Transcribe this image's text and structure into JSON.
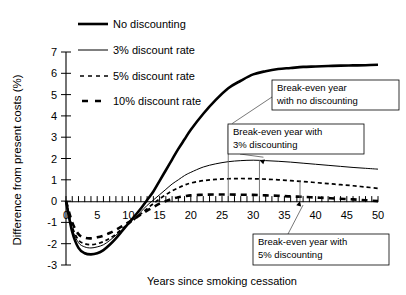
{
  "chart_data": {
    "type": "line",
    "title": "",
    "xlabel": "Years since smoking cessation",
    "ylabel": "Difference from present costs (%)",
    "xlim": [
      0,
      50
    ],
    "ylim": [
      -3,
      7
    ],
    "xticks": [
      0,
      5,
      10,
      15,
      20,
      25,
      30,
      35,
      40,
      45,
      50
    ],
    "xticklabels": [
      "0",
      "5",
      "10",
      "15",
      "20",
      "25",
      "30",
      "35",
      "40",
      "45",
      "50"
    ],
    "yticks": [
      -3,
      -2,
      -1,
      0,
      1,
      2,
      3,
      4,
      5,
      6,
      7
    ],
    "yticklabels": [
      "-3",
      "-2",
      "-1",
      "0",
      "1",
      "2",
      "3",
      "4",
      "5",
      "6",
      "7"
    ],
    "grid": false,
    "legend_position": "top-left",
    "x": [
      0,
      1,
      2,
      3,
      4,
      5,
      6,
      7,
      8,
      9,
      10,
      11,
      12,
      13,
      14,
      15,
      16,
      17,
      18,
      19,
      20,
      22,
      24,
      26,
      28,
      30,
      32,
      34,
      36,
      38,
      40,
      42,
      44,
      46,
      48,
      50
    ],
    "series": [
      {
        "name": "No discounting",
        "style": "solid-bold",
        "values": [
          0,
          -1.45,
          -2.2,
          -2.45,
          -2.5,
          -2.45,
          -2.3,
          -2.05,
          -1.75,
          -1.4,
          -1.05,
          -0.7,
          -0.35,
          0.05,
          0.45,
          0.95,
          1.45,
          1.95,
          2.45,
          2.9,
          3.35,
          4.1,
          4.75,
          5.3,
          5.65,
          5.95,
          6.1,
          6.2,
          6.25,
          6.3,
          6.32,
          6.34,
          6.36,
          6.37,
          6.38,
          6.4
        ]
      },
      {
        "name": "3% discount rate",
        "style": "solid-thin",
        "values": [
          0,
          -1.3,
          -1.95,
          -2.15,
          -2.2,
          -2.15,
          -2.05,
          -1.85,
          -1.6,
          -1.35,
          -1.05,
          -0.8,
          -0.5,
          -0.2,
          0.05,
          0.3,
          0.55,
          0.8,
          1.0,
          1.2,
          1.35,
          1.6,
          1.75,
          1.85,
          1.9,
          1.92,
          1.9,
          1.87,
          1.83,
          1.78,
          1.73,
          1.68,
          1.63,
          1.58,
          1.54,
          1.5
        ]
      },
      {
        "name": "5% discount rate",
        "style": "dashed-fine",
        "values": [
          0,
          -1.2,
          -1.82,
          -2.0,
          -2.05,
          -2.0,
          -1.9,
          -1.75,
          -1.55,
          -1.3,
          -1.08,
          -0.85,
          -0.6,
          -0.35,
          -0.12,
          0.1,
          0.3,
          0.48,
          0.62,
          0.75,
          0.85,
          0.96,
          1.02,
          1.05,
          1.06,
          1.05,
          1.03,
          1.0,
          0.96,
          0.92,
          0.87,
          0.82,
          0.77,
          0.72,
          0.66,
          0.6
        ]
      },
      {
        "name": "10% discount rate",
        "style": "dashed-bold",
        "values": [
          0,
          -1.0,
          -1.55,
          -1.72,
          -1.75,
          -1.7,
          -1.62,
          -1.5,
          -1.35,
          -1.18,
          -1.0,
          -0.82,
          -0.62,
          -0.45,
          -0.28,
          -0.12,
          0.0,
          0.1,
          0.18,
          0.23,
          0.27,
          0.3,
          0.31,
          0.31,
          0.3,
          0.29,
          0.27,
          0.25,
          0.22,
          0.2,
          0.17,
          0.14,
          0.11,
          0.08,
          0.04,
          0.0
        ]
      }
    ],
    "annotations": [
      {
        "id": "no-discounting",
        "text_line1": "Break-even year",
        "text_line2": "with no discounting",
        "target_x": 26,
        "target_y": 3.55
      },
      {
        "id": "three-percent",
        "text_line1": "Break-even year with",
        "text_line2": "3% discounting",
        "target_x": 31,
        "target_y": 1.92
      },
      {
        "id": "five-percent",
        "text_line1": "Break-even year with",
        "text_line2": "5% discounting",
        "target_x": 37.5,
        "target_y": 0.0
      }
    ]
  },
  "legend": {
    "items": [
      {
        "label": "No discounting",
        "style": "solid-bold"
      },
      {
        "label": "3% discount rate",
        "style": "solid-thin"
      },
      {
        "label": "5% discount rate",
        "style": "dashed-fine"
      },
      {
        "label": "10% discount rate",
        "style": "dashed-bold"
      }
    ]
  }
}
